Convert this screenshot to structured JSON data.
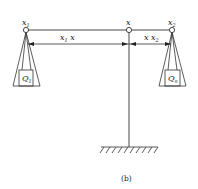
{
  "diagram": {
    "labels": {
      "x1": "x",
      "x1_sub": "1",
      "x": "x",
      "x2": "x",
      "x2_sub": "2",
      "dim_left": "x",
      "dim_left_sub": "1",
      "dim_left_tail": " x",
      "dim_right": "x x",
      "dim_right_sub": "2",
      "q1": "Q",
      "q1_sub": "1",
      "qn": "Q",
      "qn_sub": "n",
      "caption": "(b)"
    },
    "colors": {
      "line": "#333333",
      "background": "#ffffff"
    }
  }
}
